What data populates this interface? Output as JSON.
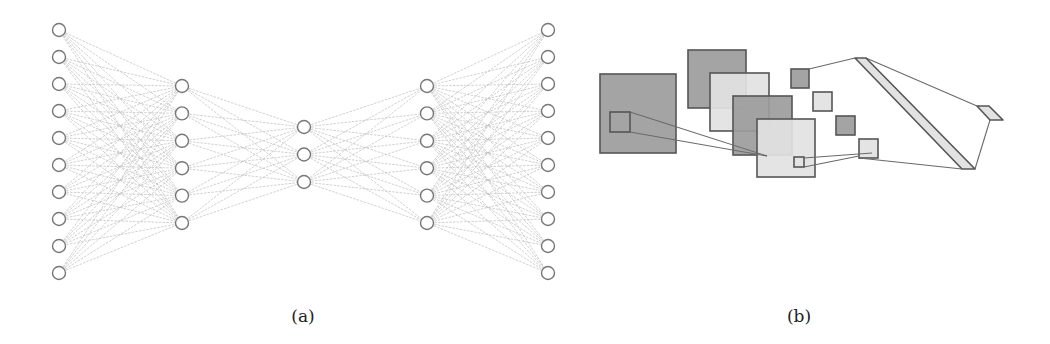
{
  "figure": {
    "captions": [
      {
        "id": "a",
        "text": "(a)",
        "x": 303
      },
      {
        "id": "b",
        "text": "(b)",
        "x": 799
      }
    ]
  },
  "colors": {
    "node_stroke": "#777777",
    "edge": "#bdbdbd",
    "dark_fill": "#9c9c9c",
    "light_fill": "#e2e2e2",
    "border": "#555555",
    "line": "#6a6a6a"
  },
  "panel_a": {
    "title": "autoencoder fully-connected network",
    "node_radius": 6.5,
    "layers": [
      {
        "name": "input",
        "x": 59,
        "count": 10,
        "y_start": 30,
        "y_end": 273
      },
      {
        "name": "hidden-1",
        "x": 182,
        "count": 6,
        "y_start": 86,
        "y_end": 223
      },
      {
        "name": "bottleneck",
        "x": 304,
        "count": 3,
        "y_start": 127,
        "y_end": 182
      },
      {
        "name": "hidden-2",
        "x": 427,
        "count": 6,
        "y_start": 86,
        "y_end": 223
      },
      {
        "name": "output",
        "x": 548,
        "count": 10,
        "y_start": 30,
        "y_end": 273
      }
    ]
  },
  "panel_b": {
    "title": "convolutional network schematic",
    "rects": [
      {
        "name": "input-map",
        "x": 600,
        "y": 74,
        "w": 76,
        "h": 79,
        "fill": "dark"
      },
      {
        "name": "input-receptive-field",
        "x": 610,
        "y": 112,
        "w": 20,
        "h": 20,
        "fill": "none"
      },
      {
        "name": "feature-map-1",
        "x": 688,
        "y": 50,
        "w": 58,
        "h": 58,
        "fill": "dark"
      },
      {
        "name": "feature-map-2",
        "x": 710,
        "y": 73,
        "w": 59,
        "h": 58,
        "fill": "light"
      },
      {
        "name": "feature-map-3",
        "x": 733,
        "y": 96,
        "w": 59,
        "h": 59,
        "fill": "dark"
      },
      {
        "name": "feature-map-4",
        "x": 757,
        "y": 119,
        "w": 58,
        "h": 58,
        "fill": "light"
      },
      {
        "name": "feature-receptive-field",
        "x": 794,
        "y": 157,
        "w": 10,
        "h": 10,
        "fill": "none"
      },
      {
        "name": "pooled-map-1",
        "x": 791,
        "y": 69,
        "w": 18,
        "h": 19,
        "fill": "dark"
      },
      {
        "name": "pooled-map-2",
        "x": 813,
        "y": 92,
        "w": 19,
        "h": 19,
        "fill": "light"
      },
      {
        "name": "pooled-map-3",
        "x": 836,
        "y": 116,
        "w": 19,
        "h": 19,
        "fill": "dark"
      },
      {
        "name": "pooled-map-4",
        "x": 859,
        "y": 139,
        "w": 19,
        "h": 19,
        "fill": "light"
      }
    ],
    "polygons": [
      {
        "name": "dense-layer-bar",
        "points": "855,58 866,58 975,169 962,169",
        "fill": "light"
      },
      {
        "name": "output-layer",
        "points": "977,106 989,106 1003,120 990,120",
        "fill": "light"
      }
    ],
    "lines": [
      {
        "name": "conv-connection-top",
        "x1": 630,
        "y1": 112,
        "x2": 767,
        "y2": 156
      },
      {
        "name": "conv-connection-bottom",
        "x1": 630,
        "y1": 132,
        "x2": 767,
        "y2": 156
      },
      {
        "name": "pool-connection-top",
        "x1": 804,
        "y1": 158,
        "x2": 872,
        "y2": 153
      },
      {
        "name": "pool-connection-bottom",
        "x1": 804,
        "y1": 167,
        "x2": 859,
        "y2": 156
      },
      {
        "name": "flatten-connection-top",
        "x1": 809,
        "y1": 69,
        "x2": 855,
        "y2": 58
      },
      {
        "name": "flatten-connection-bottom",
        "x1": 859,
        "y1": 158,
        "x2": 962,
        "y2": 169
      },
      {
        "name": "dense-connection-top",
        "x1": 866,
        "y1": 58,
        "x2": 977,
        "y2": 106
      },
      {
        "name": "dense-connection-bottom",
        "x1": 975,
        "y1": 169,
        "x2": 990,
        "y2": 120
      }
    ]
  }
}
